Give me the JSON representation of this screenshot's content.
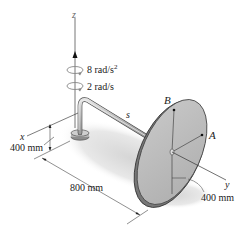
{
  "figure": {
    "axes": {
      "z_label": "z",
      "x_label": "x",
      "y_label": "y"
    },
    "angular_acceleration": {
      "value": "8 rad/s",
      "exponent": "2"
    },
    "angular_velocity": "2 rad/s",
    "shaft_label": "s",
    "points": {
      "A": "A",
      "B": "B"
    },
    "dimensions": {
      "base_height": "400 mm",
      "arm_length": "800 mm",
      "disk_radius": "400 mm"
    },
    "colors": {
      "disk_fill": "#b9b9b9",
      "disk_edge": "#555555",
      "shaft": "#9c9c9c",
      "shadow": "#e2e2e2",
      "line": "#444444"
    }
  }
}
